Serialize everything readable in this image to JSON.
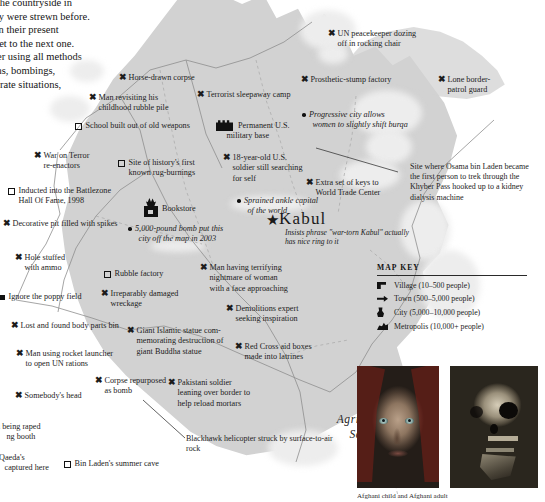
{
  "intro_text": {
    "lines": [
      "ss the countryside in",
      "they were strewn before.",
      "is in their present",
      "o get to the next one.",
      "after using all methods",
      "guns, bombings,",
      "sperate situations,"
    ]
  },
  "capital": {
    "name": "Kabul",
    "marker": "star",
    "note": "Insists phrase \"war-torn Kabul\" actually has nice ring to it"
  },
  "sector": {
    "line1": "Agritorture",
    "line2": "Sector"
  },
  "annotations": {
    "osama": "Site where Osama bin Laden became the first person to trek through the Khyber Pass hooked up to a kidney dialysis machine",
    "blackhawk": "Blackhawk helicopter struck by surface-to-air rock"
  },
  "map_key": {
    "title": "MAP KEY",
    "entries": [
      {
        "icon": "village-icon",
        "label": "Village (10–500 people)"
      },
      {
        "icon": "town-icon",
        "label": "Town (500–5,000 people)"
      },
      {
        "icon": "city-icon",
        "label": "City (5,000–10,000 people)"
      },
      {
        "icon": "metropolis-icon",
        "label": "Metropolis (10,000+ people)"
      }
    ]
  },
  "labels": [
    {
      "marker": "x",
      "text": "Horse-drawn corpse",
      "x": 118,
      "y": 72,
      "w": 92,
      "italic": false
    },
    {
      "marker": "x",
      "text": "Man revisiting his",
      "x": 88,
      "y": 92,
      "w": 92,
      "italic": false,
      "cont": "childhood rubble pile"
    },
    {
      "marker": "sq",
      "text": "School built out of old weapons",
      "x": 75,
      "y": 121,
      "w": 150,
      "italic": false
    },
    {
      "marker": "x",
      "text": "Terrorist sleepaway camp",
      "x": 196,
      "y": 89,
      "w": 120,
      "italic": false,
      "square": true
    },
    {
      "marker": "x",
      "text": "War on Terror",
      "x": 33,
      "y": 150,
      "w": 80,
      "italic": false,
      "cont": "re-enactors"
    },
    {
      "marker": "sq",
      "text": "Site of history's first",
      "x": 118,
      "y": 158,
      "w": 90,
      "italic": false,
      "cont": "known rug-burnings"
    },
    {
      "marker": "sq",
      "text": "Inducted into the Battlezone",
      "x": 8,
      "y": 186,
      "w": 130,
      "italic": false,
      "cont": "Hall Of Fame, 1998"
    },
    {
      "marker": "base",
      "text": "Permanent U.S.",
      "x": 216,
      "y": 118,
      "w": 80,
      "italic": false,
      "cont": "military base"
    },
    {
      "marker": "x",
      "text": "18-year-old U.S.",
      "x": 222,
      "y": 152,
      "w": 84,
      "italic": false,
      "cont": "soldier still searching",
      "cont2": "for self"
    },
    {
      "marker": "x",
      "text": "UN peacekeeper dozing",
      "x": 327,
      "y": 28,
      "w": 108,
      "italic": false,
      "cont": "off in rocking chair"
    },
    {
      "marker": "x",
      "text": "Prosthetic-stump factory",
      "x": 300,
      "y": 74,
      "w": 116,
      "italic": false
    },
    {
      "marker": "x",
      "text": "Lone border-",
      "x": 437,
      "y": 74,
      "w": 70,
      "italic": false,
      "cont": "patrol guard"
    },
    {
      "marker": "dot",
      "text": "Progressive city allows",
      "x": 302,
      "y": 110,
      "w": 110,
      "italic": true,
      "cont": "women to slightly shift burqa"
    },
    {
      "marker": "x",
      "text": "Extra set of keys to",
      "x": 305,
      "y": 177,
      "w": 96,
      "italic": false,
      "cont": "World Trade Center"
    },
    {
      "marker": "x",
      "text": "Decorative pit filled with spikes",
      "x": 2,
      "y": 218,
      "w": 150,
      "italic": false
    },
    {
      "marker": "book",
      "text": "Bookstore",
      "x": 143,
      "y": 198,
      "w": 60,
      "italic": false
    },
    {
      "marker": "dot",
      "text": "Sprained ankle capital",
      "x": 237,
      "y": 196,
      "w": 92,
      "italic": true,
      "cont": "of the world"
    },
    {
      "marker": "dot",
      "text": "5,000-pound bomb put this",
      "x": 128,
      "y": 224,
      "w": 112,
      "italic": true,
      "cont": "city off the map in 2003"
    },
    {
      "marker": "x",
      "text": "Hole stuffed",
      "x": 14,
      "y": 252,
      "w": 70,
      "italic": false,
      "cont": "with ammo"
    },
    {
      "marker": "sq",
      "text": "Rubble factory",
      "x": 104,
      "y": 269,
      "w": 80,
      "italic": false
    },
    {
      "marker": "x",
      "text": "Man having terrifying",
      "x": 199,
      "y": 262,
      "w": 104,
      "italic": false,
      "cont": "nightmare of woman",
      "cont2": "with a face approaching"
    },
    {
      "marker": "sqf",
      "text": "Ignore the poppy field",
      "x": 0,
      "y": 292,
      "w": 110,
      "italic": false
    },
    {
      "marker": "x",
      "text": "Irreparably damaged",
      "x": 100,
      "y": 288,
      "w": 96,
      "italic": false,
      "cont": "wreckage"
    },
    {
      "marker": "x",
      "text": "Demolitions expert",
      "x": 225,
      "y": 303,
      "w": 92,
      "italic": false,
      "cont": "seeking inspiration"
    },
    {
      "marker": "x",
      "text": "Lost and found body parts bin",
      "x": 10,
      "y": 320,
      "w": 140,
      "italic": false
    },
    {
      "marker": "x",
      "text": "Giant Islamic statue com-",
      "x": 126,
      "y": 325,
      "w": 106,
      "italic": false,
      "cont": "memorating destruction of",
      "cont2": "giant Buddha statue"
    },
    {
      "marker": "x",
      "text": "Red Cross aid boxes",
      "x": 234,
      "y": 341,
      "w": 96,
      "italic": false,
      "cont": "made into latrines"
    },
    {
      "marker": "x",
      "text": "Man using rocket launcher",
      "x": 15,
      "y": 348,
      "w": 124,
      "italic": false,
      "cont": "to open UN rations"
    },
    {
      "marker": "x",
      "text": "Corpse repurposed",
      "x": 94,
      "y": 375,
      "w": 88,
      "italic": false,
      "cont": "as bomb"
    },
    {
      "marker": "x",
      "text": "Pakistani soldier",
      "x": 167,
      "y": 377,
      "w": 88,
      "italic": false,
      "cont": "leaning over border to",
      "cont2": "help reload mortars"
    },
    {
      "marker": "x",
      "text": "Somebody's head",
      "x": 14,
      "y": 390,
      "w": 92,
      "italic": false
    },
    {
      "marker": "none",
      "text": "n being raped",
      "x": -4,
      "y": 422,
      "w": 86,
      "italic": false,
      "cont": "ng booth"
    },
    {
      "marker": "none",
      "text": "l-Qaeda's",
      "x": -6,
      "y": 453,
      "w": 80,
      "italic": false,
      "cont": "captured here"
    },
    {
      "marker": "sq",
      "text": "Bin Laden's summer cave",
      "x": 64,
      "y": 459,
      "w": 124,
      "italic": false
    }
  ],
  "photo_caption": "Afghani child and Afghani adult"
}
